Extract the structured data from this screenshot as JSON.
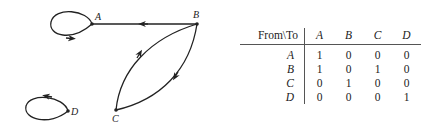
{
  "graph": {
    "nodes": [
      {
        "id": "A",
        "label": "A"
      },
      {
        "id": "B",
        "label": "B"
      },
      {
        "id": "C",
        "label": "C"
      },
      {
        "id": "D",
        "label": "D"
      }
    ],
    "edges": [
      {
        "from": "A",
        "to": "A"
      },
      {
        "from": "B",
        "to": "A"
      },
      {
        "from": "B",
        "to": "C"
      },
      {
        "from": "C",
        "to": "B"
      },
      {
        "from": "D",
        "to": "D"
      }
    ]
  },
  "matrix": {
    "corner_label": "From\\To",
    "columns": [
      "A",
      "B",
      "C",
      "D"
    ],
    "rows": [
      {
        "label": "A",
        "values": [
          "1",
          "0",
          "0",
          "0"
        ]
      },
      {
        "label": "B",
        "values": [
          "1",
          "0",
          "1",
          "0"
        ]
      },
      {
        "label": "C",
        "values": [
          "0",
          "1",
          "0",
          "0"
        ]
      },
      {
        "label": "D",
        "values": [
          "0",
          "0",
          "0",
          "1"
        ]
      }
    ]
  }
}
